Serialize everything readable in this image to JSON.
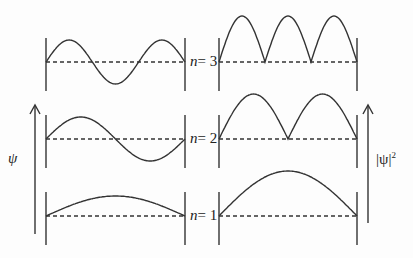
{
  "diagram": {
    "left_axis_label": "ψ",
    "right_axis_label": "|ψ|",
    "right_axis_exponent": "2",
    "levels": [
      {
        "n": 3,
        "label_var": "n",
        "label_eq": "= 3"
      },
      {
        "n": 2,
        "label_var": "n",
        "label_eq": "= 2"
      },
      {
        "n": 1,
        "label_var": "n",
        "label_eq": "= 1"
      }
    ],
    "colors": {
      "line": "#333333",
      "background": "#fdfdfd"
    }
  }
}
